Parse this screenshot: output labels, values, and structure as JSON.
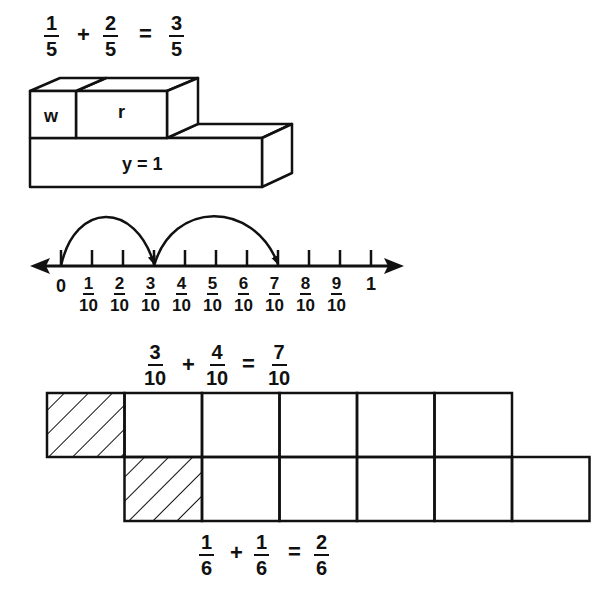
{
  "equations": {
    "fifths": {
      "a": {
        "num": "1",
        "den": "5"
      },
      "plus": "+",
      "b": {
        "num": "2",
        "den": "5"
      },
      "equals": "=",
      "result": {
        "num": "3",
        "den": "5"
      }
    },
    "tenths": {
      "a": {
        "num": "3",
        "den": "10"
      },
      "plus": "+",
      "b": {
        "num": "4",
        "den": "10"
      },
      "equals": "=",
      "result": {
        "num": "7",
        "den": "10"
      }
    },
    "sixths": {
      "a": {
        "num": "1",
        "den": "6"
      },
      "plus": "+",
      "b": {
        "num": "1",
        "den": "6"
      },
      "equals": "=",
      "result": {
        "num": "2",
        "den": "6"
      }
    }
  },
  "rods": {
    "w_label": "w",
    "r_label": "r",
    "y_label": "y = 1",
    "w_units": 1,
    "r_units": 2,
    "y_units": 5
  },
  "number_line": {
    "start_label": "0",
    "end_label": "1",
    "tick_fractions": [
      {
        "num": "1",
        "den": "10"
      },
      {
        "num": "2",
        "den": "10"
      },
      {
        "num": "3",
        "den": "10"
      },
      {
        "num": "4",
        "den": "10"
      },
      {
        "num": "5",
        "den": "10"
      },
      {
        "num": "6",
        "den": "10"
      },
      {
        "num": "7",
        "den": "10"
      },
      {
        "num": "8",
        "den": "10"
      },
      {
        "num": "9",
        "den": "10"
      }
    ],
    "divisions": 10,
    "jumps": [
      {
        "from": 0,
        "to": 3
      },
      {
        "from": 3,
        "to": 7
      }
    ]
  },
  "grid": {
    "rows": [
      {
        "cells": 6,
        "shaded": [
          0
        ]
      },
      {
        "cells": 6,
        "shaded": [
          0
        ]
      }
    ],
    "row_offset_cells": 1
  },
  "colors": {
    "ink": "#111111",
    "paper": "#ffffff"
  }
}
